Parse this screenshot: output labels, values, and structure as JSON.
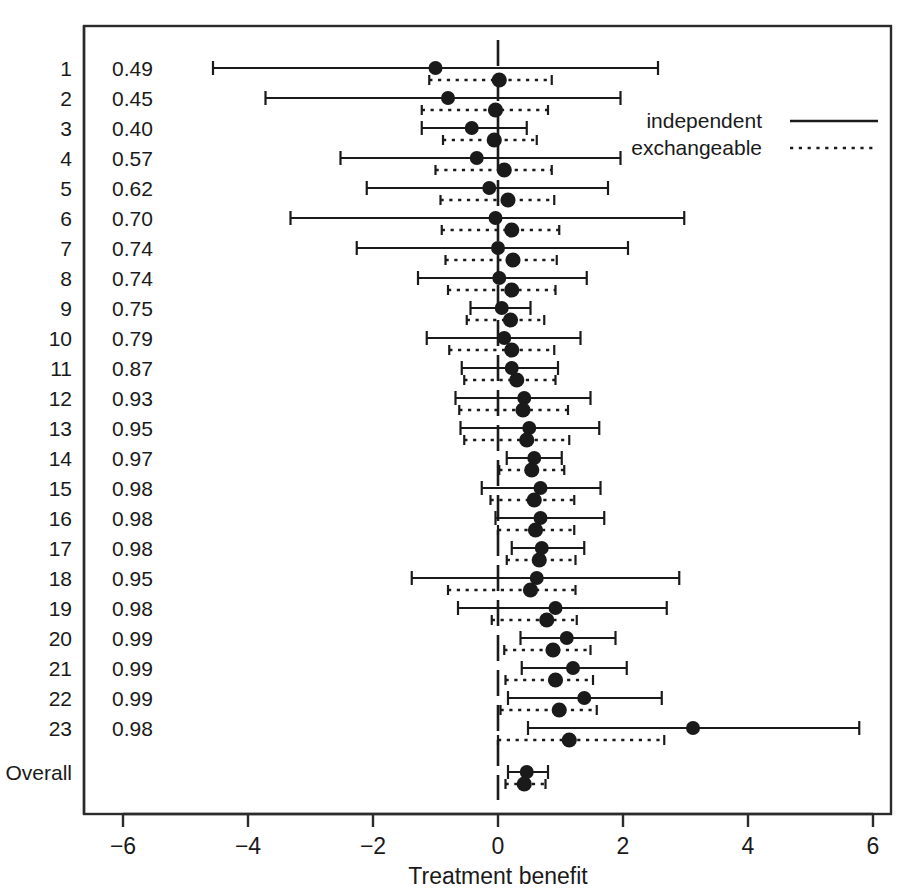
{
  "chart_data": {
    "type": "forest",
    "title": "",
    "xlabel": "Treatment benefit",
    "ylabel": "",
    "xlim": [
      -6.8,
      6.4
    ],
    "xticks": [
      -6,
      -4,
      -2,
      0,
      2,
      4,
      6
    ],
    "xticklabels": [
      "−6",
      "−4",
      "−2",
      "0",
      "2",
      "4",
      "6"
    ],
    "grid": false,
    "reference_line": 0,
    "columns": [
      "Study",
      "Posterior probability"
    ],
    "legend": {
      "position": "upper-right-inside",
      "entries": [
        {
          "label": "independent",
          "style": "solid"
        },
        {
          "label": "exchangeable",
          "style": "dotted"
        }
      ]
    },
    "series": [
      {
        "name": "independent",
        "style": "solid"
      },
      {
        "name": "exchangeable",
        "style": "dotted"
      }
    ],
    "rows": [
      {
        "study": "1",
        "prob": "0.49",
        "independent": {
          "est": -1.0,
          "lo": -4.56,
          "hi": 2.56
        },
        "exchangeable": {
          "est": 0.02,
          "lo": -1.1,
          "hi": 0.86
        }
      },
      {
        "study": "2",
        "prob": "0.45",
        "independent": {
          "est": -0.8,
          "lo": -3.72,
          "hi": 1.96
        },
        "exchangeable": {
          "est": -0.04,
          "lo": -1.22,
          "hi": 0.8
        }
      },
      {
        "study": "3",
        "prob": "0.40",
        "independent": {
          "est": -0.42,
          "lo": -1.22,
          "hi": 0.46
        },
        "exchangeable": {
          "est": -0.06,
          "lo": -0.88,
          "hi": 0.62
        }
      },
      {
        "study": "4",
        "prob": "0.57",
        "independent": {
          "est": -0.34,
          "lo": -2.52,
          "hi": 1.96
        },
        "exchangeable": {
          "est": 0.1,
          "lo": -1.0,
          "hi": 0.86
        }
      },
      {
        "study": "5",
        "prob": "0.62",
        "independent": {
          "est": -0.14,
          "lo": -2.1,
          "hi": 1.76
        },
        "exchangeable": {
          "est": 0.16,
          "lo": -0.92,
          "hi": 0.9
        }
      },
      {
        "study": "6",
        "prob": "0.70",
        "independent": {
          "est": -0.04,
          "lo": -3.32,
          "hi": 2.98
        },
        "exchangeable": {
          "est": 0.22,
          "lo": -0.9,
          "hi": 0.98
        }
      },
      {
        "study": "7",
        "prob": "0.74",
        "independent": {
          "est": 0.0,
          "lo": -2.26,
          "hi": 2.08
        },
        "exchangeable": {
          "est": 0.24,
          "lo": -0.84,
          "hi": 0.94
        }
      },
      {
        "study": "8",
        "prob": "0.74",
        "independent": {
          "est": 0.02,
          "lo": -1.28,
          "hi": 1.42
        },
        "exchangeable": {
          "est": 0.22,
          "lo": -0.8,
          "hi": 0.92
        }
      },
      {
        "study": "9",
        "prob": "0.75",
        "independent": {
          "est": 0.06,
          "lo": -0.44,
          "hi": 0.52
        },
        "exchangeable": {
          "est": 0.2,
          "lo": -0.5,
          "hi": 0.74
        }
      },
      {
        "study": "10",
        "prob": "0.79",
        "independent": {
          "est": 0.1,
          "lo": -1.14,
          "hi": 1.32
        },
        "exchangeable": {
          "est": 0.22,
          "lo": -0.78,
          "hi": 0.9
        }
      },
      {
        "study": "11",
        "prob": "0.87",
        "independent": {
          "est": 0.22,
          "lo": -0.58,
          "hi": 0.96
        },
        "exchangeable": {
          "est": 0.3,
          "lo": -0.54,
          "hi": 0.92
        }
      },
      {
        "study": "12",
        "prob": "0.93",
        "independent": {
          "est": 0.42,
          "lo": -0.68,
          "hi": 1.48
        },
        "exchangeable": {
          "est": 0.4,
          "lo": -0.62,
          "hi": 1.12
        }
      },
      {
        "study": "13",
        "prob": "0.95",
        "independent": {
          "est": 0.5,
          "lo": -0.6,
          "hi": 1.62
        },
        "exchangeable": {
          "est": 0.46,
          "lo": -0.54,
          "hi": 1.14
        }
      },
      {
        "study": "14",
        "prob": "0.97",
        "independent": {
          "est": 0.58,
          "lo": 0.14,
          "hi": 1.02
        },
        "exchangeable": {
          "est": 0.54,
          "lo": 0.02,
          "hi": 1.06
        }
      },
      {
        "study": "15",
        "prob": "0.98",
        "independent": {
          "est": 0.68,
          "lo": -0.26,
          "hi": 1.64
        },
        "exchangeable": {
          "est": 0.58,
          "lo": -0.12,
          "hi": 1.22
        }
      },
      {
        "study": "16",
        "prob": "0.98",
        "independent": {
          "est": 0.68,
          "lo": -0.04,
          "hi": 1.7
        },
        "exchangeable": {
          "est": 0.6,
          "lo": 0.0,
          "hi": 1.22
        }
      },
      {
        "study": "17",
        "prob": "0.98",
        "independent": {
          "est": 0.7,
          "lo": 0.22,
          "hi": 1.38
        },
        "exchangeable": {
          "est": 0.66,
          "lo": 0.14,
          "hi": 1.24
        }
      },
      {
        "study": "18",
        "prob": "0.95",
        "independent": {
          "est": 0.62,
          "lo": -1.38,
          "hi": 2.9
        },
        "exchangeable": {
          "est": 0.52,
          "lo": -0.8,
          "hi": 1.24
        }
      },
      {
        "study": "19",
        "prob": "0.98",
        "independent": {
          "est": 0.92,
          "lo": -0.64,
          "hi": 2.7
        },
        "exchangeable": {
          "est": 0.78,
          "lo": -0.1,
          "hi": 1.26
        }
      },
      {
        "study": "20",
        "prob": "0.99",
        "independent": {
          "est": 1.1,
          "lo": 0.36,
          "hi": 1.88
        },
        "exchangeable": {
          "est": 0.88,
          "lo": 0.1,
          "hi": 1.48
        }
      },
      {
        "study": "21",
        "prob": "0.99",
        "independent": {
          "est": 1.2,
          "lo": 0.38,
          "hi": 2.06
        },
        "exchangeable": {
          "est": 0.92,
          "lo": 0.12,
          "hi": 1.52
        }
      },
      {
        "study": "22",
        "prob": "0.99",
        "independent": {
          "est": 1.38,
          "lo": 0.16,
          "hi": 2.62
        },
        "exchangeable": {
          "est": 0.98,
          "lo": 0.04,
          "hi": 1.58
        }
      },
      {
        "study": "23",
        "prob": "0.98",
        "independent": {
          "est": 3.12,
          "lo": 0.48,
          "hi": 5.78
        },
        "exchangeable": {
          "est": 1.14,
          "lo": 0.0,
          "hi": 2.66
        }
      },
      {
        "study": "Overall",
        "prob": "",
        "independent": {
          "est": 0.46,
          "lo": 0.16,
          "hi": 0.8
        },
        "exchangeable": {
          "est": 0.42,
          "lo": 0.12,
          "hi": 0.76
        }
      }
    ]
  },
  "axis": {
    "xlabel": "Treatment benefit",
    "ticklabels": [
      "−6",
      "−4",
      "−2",
      "0",
      "2",
      "4",
      "6"
    ]
  },
  "legend": {
    "independent_label": "independent",
    "exchangeable_label": "exchangeable"
  },
  "colors": {
    "ink": "#1a1a1a",
    "frame": "#2b2b2b",
    "background": "#ffffff"
  }
}
